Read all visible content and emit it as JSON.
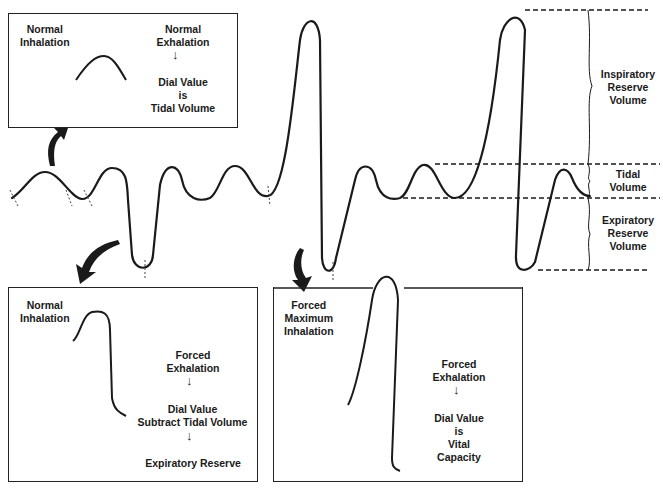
{
  "top_box": {
    "left_label": [
      "Normal",
      "Inhalation"
    ],
    "right_label_top": [
      "Normal",
      "Exhalation"
    ],
    "right_label_bottom": [
      "Dial Value",
      "is",
      "Tidal Volume"
    ]
  },
  "bottom_left_box": {
    "left_label": [
      "Normal",
      "Inhalation"
    ],
    "step1": [
      "Forced",
      "Exhalation"
    ],
    "step2": [
      "Dial Value",
      "Subtract Tidal Volume"
    ],
    "step3": "Expiratory Reserve"
  },
  "bottom_right_box": {
    "left_label": [
      "Forced",
      "Maximum",
      "Inhalation"
    ],
    "step1": [
      "Forced",
      "Exhalation"
    ],
    "step2": [
      "Dial Value",
      "is",
      "Vital",
      "Capacity"
    ]
  },
  "legend": {
    "irv": [
      "Inspiratory",
      "Reserve",
      "Volume"
    ],
    "tv": [
      "Tidal",
      "Volume"
    ],
    "erv": [
      "Expiratory",
      "Reserve",
      "Volume"
    ]
  },
  "colors": {
    "ink": "#1a1a1a",
    "background": "#ffffff"
  }
}
